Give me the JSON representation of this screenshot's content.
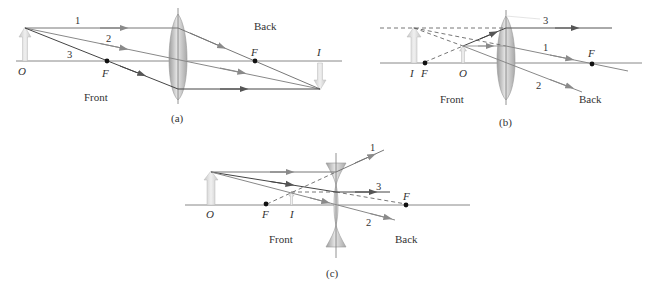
{
  "figures": {
    "a": {
      "caption": "(a)",
      "lens_type": "converging",
      "labels": {
        "object": "O",
        "image": "I",
        "focal_front": "F",
        "focal_back": "F",
        "front": "Front",
        "back": "Back",
        "ray1": "1",
        "ray2": "2",
        "ray3": "3"
      }
    },
    "b": {
      "caption": "(b)",
      "lens_type": "converging",
      "labels": {
        "object": "O",
        "image": "I",
        "focal_front": "F",
        "focal_back": "F",
        "front": "Front",
        "back": "Back",
        "ray1": "1",
        "ray2": "2",
        "ray3": "3"
      }
    },
    "c": {
      "caption": "(c)",
      "lens_type": "diverging",
      "labels": {
        "object": "O",
        "image": "I",
        "focal_front": "F",
        "focal_back": "F",
        "front": "Front",
        "back": "Back",
        "ray1": "1",
        "ray2": "2",
        "ray3": "3"
      }
    }
  },
  "colors": {
    "axis": "#777777",
    "ray": "#555555",
    "ray_light": "#888888",
    "arrow_object": "#d9d9d9",
    "lens_fill": "#b8b8b8",
    "focal_point": "#111111"
  }
}
